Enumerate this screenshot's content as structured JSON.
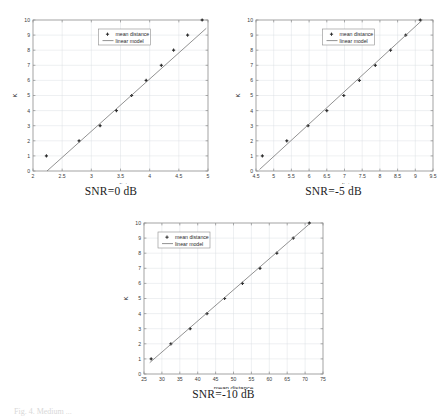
{
  "figure": {
    "bottom_caption": "Fig. 4. Medium ...",
    "legend": {
      "series_label": "mean distance",
      "model_label": "linear model"
    },
    "panels": [
      {
        "id": "snr-0",
        "caption": "SNR=0 dB",
        "chart_data": {
          "type": "scatter",
          "title": "",
          "xlabel": "mean distance",
          "ylabel": "K",
          "xlim": [
            2,
            5
          ],
          "ylim": [
            0,
            10
          ],
          "xticks": [
            "2",
            "2.5",
            "3",
            "3.5",
            "4",
            "4.5",
            "5"
          ],
          "yticks": [
            "0",
            "1",
            "2",
            "3",
            "4",
            "5",
            "6",
            "7",
            "8",
            "9",
            "10"
          ],
          "grid": true,
          "legend_position": "top-center",
          "series": [
            {
              "name": "mean distance",
              "type": "scatter",
              "x": [
                2.23,
                2.79,
                3.15,
                3.43,
                3.69,
                3.94,
                4.2,
                4.41,
                4.65,
                4.9
              ],
              "y": [
                1,
                2,
                3,
                4,
                5,
                6,
                7,
                8,
                9,
                10
              ]
            },
            {
              "name": "linear model",
              "type": "line",
              "x": [
                2.24,
                4.97
              ],
              "y": [
                0,
                9.45
              ]
            }
          ]
        }
      },
      {
        "id": "snr-minus5",
        "caption": "SNR=-5 dB",
        "chart_data": {
          "type": "scatter",
          "title": "",
          "xlabel": "mean distances",
          "ylabel": "K",
          "xlim": [
            4.5,
            9.5
          ],
          "ylim": [
            0,
            10
          ],
          "xticks": [
            "4.5",
            "5",
            "5.5",
            "6",
            "6.5",
            "7",
            "7.5",
            "8",
            "8.5",
            "9",
            "9.5"
          ],
          "yticks": [
            "0",
            "1",
            "2",
            "3",
            "4",
            "5",
            "6",
            "7",
            "8",
            "9",
            "10"
          ],
          "grid": true,
          "legend_position": "top-center",
          "series": [
            {
              "name": "mean distance",
              "type": "scatter",
              "x": [
                4.68,
                5.37,
                5.97,
                6.5,
                6.98,
                7.42,
                7.87,
                8.3,
                8.73,
                9.14
              ],
              "y": [
                1,
                2,
                3,
                4,
                5,
                6,
                7,
                8,
                9,
                10
              ]
            },
            {
              "name": "linear model",
              "type": "line",
              "x": [
                4.6,
                9.2
              ],
              "y": [
                0.1,
                10
              ]
            }
          ]
        }
      },
      {
        "id": "snr-minus10",
        "caption": "SNR=-10 dB",
        "chart_data": {
          "type": "scatter",
          "title": "",
          "xlabel": "mean distance",
          "ylabel": "K",
          "xlim": [
            25,
            75
          ],
          "ylim": [
            0,
            10
          ],
          "xticks": [
            "25",
            "30",
            "35",
            "40",
            "45",
            "50",
            "55",
            "60",
            "65",
            "70",
            "75"
          ],
          "yticks": [
            "0",
            "1",
            "2",
            "3",
            "4",
            "5",
            "6",
            "7",
            "8",
            "9",
            "10"
          ],
          "grid": true,
          "legend_position": "top-left",
          "series": [
            {
              "name": "mean distance",
              "type": "scatter",
              "x": [
                27.0,
                32.5,
                37.9,
                42.6,
                47.5,
                52.5,
                57.4,
                62.1,
                66.7,
                71.2
              ],
              "y": [
                1,
                2,
                3,
                4,
                5,
                6,
                7,
                8,
                9,
                10
              ]
            },
            {
              "name": "linear model",
              "type": "line",
              "x": [
                26.6,
                71.5
              ],
              "y": [
                0.75,
                10
              ]
            }
          ]
        }
      }
    ]
  }
}
